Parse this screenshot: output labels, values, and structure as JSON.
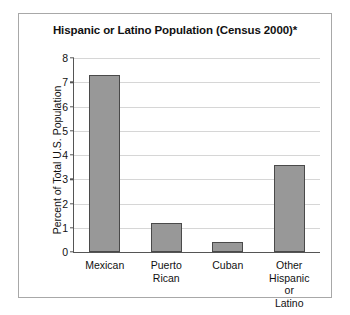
{
  "chart_data": {
    "type": "bar",
    "title": "Hispanic or Latino Population (Census 2000)*",
    "xlabel": "",
    "ylabel": "Percent of Total U.S. Population",
    "categories": [
      "Mexican",
      "Puerto\nRican",
      "Cuban",
      "Other\nHispanic\nor Latino"
    ],
    "values": [
      7.3,
      1.2,
      0.4,
      3.6
    ],
    "ylim": [
      0,
      8
    ],
    "yticks": [
      0,
      1,
      2,
      3,
      4,
      5,
      6,
      7,
      8
    ],
    "ytick_labels": [
      "0",
      "1",
      "2",
      "3",
      "4",
      "5",
      "6",
      "7",
      "8"
    ],
    "grid": true,
    "legend": false,
    "bar_color": "#989898",
    "bar_edge_color": "#4a4a4a",
    "grid_color": "#d6d6d6",
    "axis_color": "#555555",
    "plot_background": "#ffffff",
    "figure_border_color": "#a8a8a8"
  }
}
